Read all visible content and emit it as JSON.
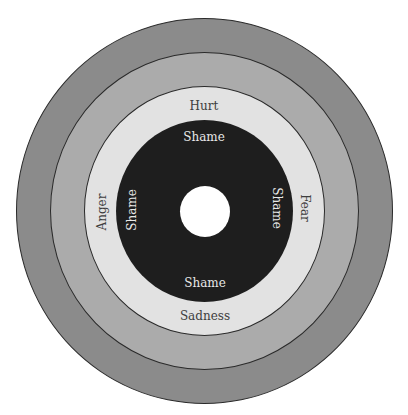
{
  "diagram": {
    "title": "",
    "rings": [
      {
        "name": "outer-ring",
        "color": "#8b8b8b"
      },
      {
        "name": "second-ring",
        "color": "#ababab"
      },
      {
        "name": "emotions-ring",
        "color": "#e2e2e2"
      },
      {
        "name": "shame-ring",
        "color": "#1e1e1e"
      },
      {
        "name": "center-hole",
        "color": "#ffffff"
      }
    ],
    "emotion_labels": {
      "top": "Hurt",
      "left": "Anger",
      "right": "Fear",
      "bottom": "Sadness"
    },
    "shame_labels": {
      "top": "Shame",
      "left": "Shame",
      "right": "Shame",
      "bottom": "Shame"
    }
  }
}
